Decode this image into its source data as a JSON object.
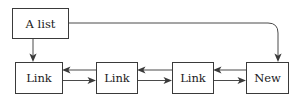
{
  "diagram": {
    "title": "A list",
    "canvas": {
      "width": 297,
      "height": 99,
      "background": "#ffffff"
    },
    "stroke_color": "#3a3a3a",
    "text_color": "#1a1a1a",
    "nodes": [
      {
        "id": "head",
        "label": "A list",
        "x": 12,
        "y": 8,
        "w": 56,
        "h": 30
      },
      {
        "id": "link1",
        "label": "Link",
        "x": 15,
        "y": 62,
        "w": 47,
        "h": 31
      },
      {
        "id": "link2",
        "label": "Link",
        "x": 96,
        "y": 62,
        "w": 41,
        "h": 31
      },
      {
        "id": "link3",
        "label": "Link",
        "x": 172,
        "y": 62,
        "w": 41,
        "h": 31
      },
      {
        "id": "new",
        "label": "New",
        "x": 246,
        "y": 62,
        "w": 42,
        "h": 31
      }
    ],
    "edges": [
      {
        "id": "head-to-link1",
        "from": "head",
        "to": "link1",
        "direction": "down",
        "style": "straight"
      },
      {
        "id": "head-to-new",
        "from": "head",
        "to": "new",
        "direction": "right-then-down",
        "style": "rounded-elbow"
      },
      {
        "id": "link2-to-link1",
        "from": "link2",
        "to": "link1",
        "direction": "left",
        "style": "straight"
      },
      {
        "id": "link1-to-link2",
        "from": "link1",
        "to": "link2",
        "direction": "right",
        "style": "straight"
      },
      {
        "id": "link3-to-link2",
        "from": "link3",
        "to": "link2",
        "direction": "left",
        "style": "straight"
      },
      {
        "id": "link2-to-link3",
        "from": "link2",
        "to": "link3",
        "direction": "right",
        "style": "straight"
      },
      {
        "id": "new-to-link3",
        "from": "new",
        "to": "link3",
        "direction": "left",
        "style": "straight"
      },
      {
        "id": "link3-to-new",
        "from": "link3",
        "to": "new",
        "direction": "right",
        "style": "straight"
      }
    ]
  }
}
